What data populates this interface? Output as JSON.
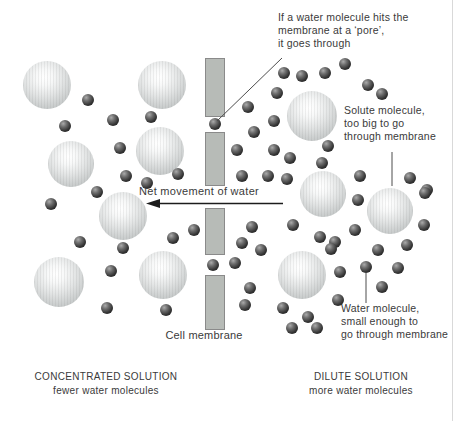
{
  "colors": {
    "background": "#ffffff",
    "text": "#3a3a3a",
    "membrane_fill": "#b7bbb7",
    "membrane_border": "#8a8a8a",
    "solute_fill": "#c9cccc",
    "water_fill": "#2a2a2a",
    "line": "#4d4d4d",
    "arrow": "#1c1c1c",
    "page_edge": "#d9d9d9"
  },
  "labels": {
    "pore_annotation": "If a water molecule hits the\nmembrane at a ‘pore’,\nit goes through",
    "solute_annotation": "Solute molecule,\ntoo big to go\nthrough membrane",
    "water_annotation": "Water molecule,\nsmall enough to\ngo through membrane",
    "net_movement": "Net movement of water",
    "cell_membrane": "Cell membrane",
    "left_solution_title": "CONCENTRATED SOLUTION",
    "left_solution_subtitle": "fewer water molecules",
    "right_solution_title": "DILUTE SOLUTION",
    "right_solution_subtitle": "more water molecules"
  },
  "diagram": {
    "membrane": {
      "x": 205,
      "width": 20,
      "segments": [
        {
          "y": 58,
          "h": 59
        },
        {
          "y": 132,
          "h": 54
        },
        {
          "y": 208,
          "h": 47
        },
        {
          "y": 275,
          "h": 55
        }
      ]
    },
    "solute_molecules": [
      {
        "x": 47,
        "y": 85,
        "r": 24
      },
      {
        "x": 162,
        "y": 85,
        "r": 24
      },
      {
        "x": 71,
        "y": 164,
        "r": 23
      },
      {
        "x": 160,
        "y": 151,
        "r": 24
      },
      {
        "x": 123,
        "y": 216,
        "r": 24
      },
      {
        "x": 59,
        "y": 282,
        "r": 25
      },
      {
        "x": 163,
        "y": 275,
        "r": 24
      },
      {
        "x": 312,
        "y": 116,
        "r": 25
      },
      {
        "x": 323,
        "y": 194,
        "r": 23
      },
      {
        "x": 390,
        "y": 211,
        "r": 23
      },
      {
        "x": 302,
        "y": 275,
        "r": 24
      }
    ],
    "water_diameter": 12,
    "water_molecules": [
      {
        "x": 88,
        "y": 100
      },
      {
        "x": 113,
        "y": 120
      },
      {
        "x": 65,
        "y": 126
      },
      {
        "x": 151,
        "y": 117
      },
      {
        "x": 120,
        "y": 148
      },
      {
        "x": 178,
        "y": 174
      },
      {
        "x": 126,
        "y": 176
      },
      {
        "x": 147,
        "y": 183
      },
      {
        "x": 97,
        "y": 192
      },
      {
        "x": 51,
        "y": 204
      },
      {
        "x": 194,
        "y": 230
      },
      {
        "x": 173,
        "y": 238
      },
      {
        "x": 80,
        "y": 242
      },
      {
        "x": 123,
        "y": 248
      },
      {
        "x": 111,
        "y": 271
      },
      {
        "x": 107,
        "y": 308
      },
      {
        "x": 166,
        "y": 310
      },
      {
        "x": 215,
        "y": 124
      },
      {
        "x": 213,
        "y": 265
      },
      {
        "x": 284,
        "y": 73
      },
      {
        "x": 302,
        "y": 76
      },
      {
        "x": 325,
        "y": 73
      },
      {
        "x": 345,
        "y": 64
      },
      {
        "x": 368,
        "y": 85
      },
      {
        "x": 382,
        "y": 94
      },
      {
        "x": 277,
        "y": 93
      },
      {
        "x": 248,
        "y": 107
      },
      {
        "x": 274,
        "y": 121
      },
      {
        "x": 254,
        "y": 132
      },
      {
        "x": 237,
        "y": 150
      },
      {
        "x": 274,
        "y": 150
      },
      {
        "x": 290,
        "y": 158
      },
      {
        "x": 328,
        "y": 146
      },
      {
        "x": 322,
        "y": 163
      },
      {
        "x": 242,
        "y": 176
      },
      {
        "x": 268,
        "y": 176
      },
      {
        "x": 287,
        "y": 179
      },
      {
        "x": 360,
        "y": 176
      },
      {
        "x": 410,
        "y": 178
      },
      {
        "x": 427,
        "y": 190
      },
      {
        "x": 358,
        "y": 200
      },
      {
        "x": 425,
        "y": 193
      },
      {
        "x": 293,
        "y": 225
      },
      {
        "x": 252,
        "y": 227
      },
      {
        "x": 355,
        "y": 230
      },
      {
        "x": 320,
        "y": 237
      },
      {
        "x": 335,
        "y": 242
      },
      {
        "x": 331,
        "y": 249
      },
      {
        "x": 242,
        "y": 243
      },
      {
        "x": 261,
        "y": 250
      },
      {
        "x": 235,
        "y": 263
      },
      {
        "x": 424,
        "y": 225
      },
      {
        "x": 407,
        "y": 245
      },
      {
        "x": 378,
        "y": 250
      },
      {
        "x": 366,
        "y": 267
      },
      {
        "x": 398,
        "y": 268
      },
      {
        "x": 340,
        "y": 272
      },
      {
        "x": 382,
        "y": 287
      },
      {
        "x": 250,
        "y": 288
      },
      {
        "x": 245,
        "y": 305
      },
      {
        "x": 283,
        "y": 308
      },
      {
        "x": 338,
        "y": 300
      },
      {
        "x": 308,
        "y": 317
      },
      {
        "x": 292,
        "y": 328
      },
      {
        "x": 317,
        "y": 328
      }
    ],
    "annotation_lines": [
      {
        "name": "pore-pointer-line",
        "x1": 282,
        "y1": 58,
        "x2": 217,
        "y2": 121
      },
      {
        "name": "solute-pointer-line",
        "x1": 392,
        "y1": 152,
        "x2": 392,
        "y2": 186
      },
      {
        "name": "water-pointer-line",
        "x1": 366,
        "y1": 273,
        "x2": 366,
        "y2": 303
      }
    ],
    "net_arrow": {
      "tail_x": 283,
      "tip_x": 146,
      "y": 203.5,
      "head_len": 14,
      "head_half": 4.5
    }
  }
}
